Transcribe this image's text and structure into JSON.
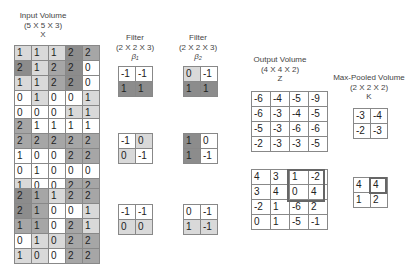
{
  "input": {
    "title": "Input Volume",
    "dims": "(5 X 5 X 3)",
    "symbol": "X",
    "channels": [
      [
        [
          1,
          1,
          1,
          2,
          2
        ],
        [
          2,
          1,
          2,
          2,
          0
        ],
        [
          1,
          1,
          2,
          2,
          0
        ],
        [
          0,
          1,
          0,
          0,
          1
        ],
        [
          0,
          0,
          0,
          1,
          1
        ]
      ],
      [
        [
          2,
          1,
          1,
          1,
          1
        ],
        [
          2,
          2,
          2,
          2,
          2
        ],
        [
          1,
          0,
          0,
          2,
          2
        ],
        [
          0,
          1,
          0,
          0,
          0
        ],
        [
          1,
          0,
          0,
          2,
          2
        ]
      ],
      [
        [
          2,
          1,
          1,
          2,
          2
        ],
        [
          2,
          1,
          0,
          0,
          1
        ],
        [
          1,
          1,
          0,
          2,
          1
        ],
        [
          0,
          1,
          0,
          2,
          2
        ],
        [
          1,
          0,
          0,
          2,
          2
        ]
      ]
    ]
  },
  "filters": [
    {
      "title": "Filter",
      "dims": "(2 X 2 X 3)",
      "symbol": "β₁",
      "channels": [
        [
          [
            -1,
            -1
          ],
          [
            1,
            1
          ]
        ],
        [
          [
            -1,
            0
          ],
          [
            0,
            -1
          ]
        ],
        [
          [
            -1,
            -1
          ],
          [
            0,
            0
          ]
        ]
      ]
    },
    {
      "title": "Filter",
      "dims": "(2 X 2 X 3)",
      "symbol": "β₂",
      "channels": [
        [
          [
            0,
            -1
          ],
          [
            1,
            1
          ]
        ],
        [
          [
            1,
            0
          ],
          [
            1,
            -1
          ]
        ],
        [
          [
            0,
            -1
          ],
          [
            1,
            -1
          ]
        ]
      ]
    }
  ],
  "output": {
    "title": "Output Volume",
    "dims": "(4 X 4 X 2)",
    "symbol": "Z",
    "channels": [
      [
        [
          -6,
          -4,
          -5,
          -9
        ],
        [
          -6,
          -3,
          -4,
          -5
        ],
        [
          -5,
          -3,
          -6,
          -6
        ],
        [
          -2,
          -3,
          -3,
          -5
        ]
      ],
      [
        [
          4,
          3,
          1,
          -2
        ],
        [
          3,
          4,
          0,
          4
        ],
        [
          -2,
          1,
          -6,
          2
        ],
        [
          0,
          1,
          -5,
          -1
        ]
      ]
    ]
  },
  "pooled": {
    "title": "Max-Pooled Volume",
    "dims": "(2 X 2 X 2)",
    "symbol": "K",
    "channels": [
      [
        [
          -3,
          -4
        ],
        [
          -2,
          -3
        ]
      ],
      [
        [
          4,
          4
        ],
        [
          1,
          2
        ]
      ]
    ]
  }
}
